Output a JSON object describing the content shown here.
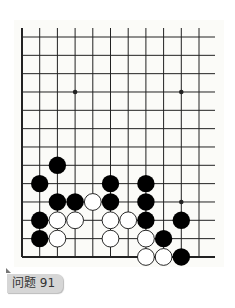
{
  "diagram": {
    "type": "go-problem",
    "grid": {
      "columns": 11,
      "rows": 13,
      "origin_x": 22,
      "origin_y": 37,
      "spacing_x": 17.7,
      "spacing_y": 18.33,
      "top_y": 28,
      "right_extend_x": 215,
      "left_edge": true,
      "bottom_edge": true
    },
    "star_points": [
      [
        3,
        3
      ],
      [
        9,
        3
      ],
      [
        9,
        9
      ]
    ],
    "stones": {
      "black": [
        [
          2,
          7
        ],
        [
          1,
          8
        ],
        [
          5,
          8
        ],
        [
          7,
          8
        ],
        [
          2,
          9
        ],
        [
          3,
          9
        ],
        [
          5,
          9
        ],
        [
          7,
          9
        ],
        [
          1,
          10
        ],
        [
          7,
          10
        ],
        [
          9,
          10
        ],
        [
          1,
          11
        ],
        [
          8,
          11
        ],
        [
          9,
          12
        ]
      ],
      "white": [
        [
          4,
          9
        ],
        [
          2,
          10
        ],
        [
          3,
          10
        ],
        [
          5,
          10
        ],
        [
          6,
          10
        ],
        [
          2,
          11
        ],
        [
          5,
          11
        ],
        [
          7,
          11
        ],
        [
          7,
          12
        ],
        [
          8,
          12
        ]
      ]
    },
    "colors": {
      "line": "#222222",
      "black": "#000000",
      "white": "#ffffff",
      "board": "#fbfbf8"
    }
  },
  "label": {
    "text": "问题 91"
  }
}
